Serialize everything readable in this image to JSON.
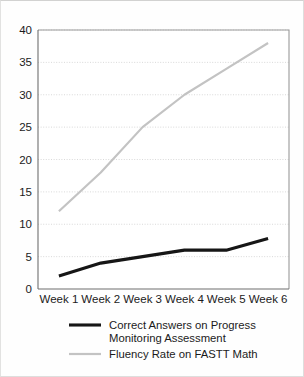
{
  "chart_data": {
    "type": "line",
    "title": "",
    "xlabel": "",
    "ylabel": "",
    "categories": [
      "Week 1",
      "Week 2",
      "Week 3",
      "Week 4",
      "Week 5",
      "Week 6"
    ],
    "ylim": [
      0,
      40
    ],
    "yticks": [
      0,
      5,
      10,
      15,
      20,
      25,
      30,
      35,
      40
    ],
    "grid": "horizontal-dotted",
    "legend_position": "bottom",
    "series": [
      {
        "name": "Correct Answers on Progress Monitoring Assessment",
        "values": [
          2,
          4,
          5,
          6,
          6,
          7.8
        ],
        "color": "#161616",
        "width": 3.1
      },
      {
        "name": "Fluency Rate on FASTT Math",
        "values": [
          12,
          18,
          25,
          30,
          34,
          38
        ],
        "color": "#c3c3c3",
        "width": 2.2
      }
    ]
  },
  "axis": {
    "y_tick_labels": [
      "40",
      "35",
      "30",
      "25",
      "20",
      "15",
      "10",
      "5",
      "0"
    ],
    "x_tick_labels": [
      "Week 1",
      "Week 2",
      "Week 3",
      "Week 4",
      "Week 5",
      "Week 6"
    ]
  },
  "legend": {
    "entries": [
      {
        "line1": "Correct Answers on Progress",
        "line2": "Monitoring Assessment",
        "color": "#161616",
        "swatch": "legend-swatch-black"
      },
      {
        "line1": "Fluency Rate on FASTT Math",
        "line2": "",
        "color": "#c3c3c3",
        "swatch": "legend-swatch-gray"
      }
    ]
  },
  "colors": {
    "series_primary": "#161616",
    "series_secondary": "#c3c3c3",
    "grid": "#cfcfcf",
    "axis": "#7a7a7a",
    "frame": "#dededd",
    "background": "#fefefe",
    "text": "#1b1b1b"
  }
}
